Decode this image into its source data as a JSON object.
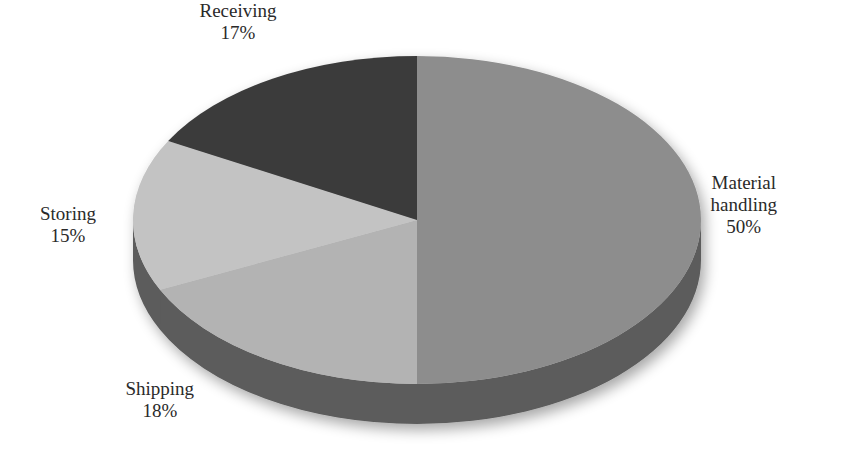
{
  "chart_data": {
    "type": "pie",
    "style": "3d-pie",
    "title": "",
    "start_angle_deg": 0,
    "direction": "clockwise",
    "slices": [
      {
        "label": "Material handling",
        "label_lines": [
          "Material",
          "handling"
        ],
        "value": 50,
        "pct_text": "50%",
        "color": "#8d8d8d",
        "label_pos": {
          "x": 744,
          "y": 205
        }
      },
      {
        "label": "Shipping",
        "label_lines": [
          "Shipping"
        ],
        "value": 18,
        "pct_text": "18%",
        "color": "#b3b3b3",
        "label_pos": {
          "x": 160,
          "y": 400
        }
      },
      {
        "label": "Storing",
        "label_lines": [
          "Storing"
        ],
        "value": 15,
        "pct_text": "15%",
        "color": "#c3c3c3",
        "label_pos": {
          "x": 68,
          "y": 225
        }
      },
      {
        "label": "Receiving",
        "label_lines": [
          "Receiving"
        ],
        "value": 17,
        "pct_text": "17%",
        "color": "#3b3b3b",
        "label_pos": {
          "x": 238,
          "y": 22
        }
      }
    ],
    "categories": [
      "Material handling",
      "Shipping",
      "Storing",
      "Receiving"
    ],
    "values": [
      50,
      18,
      15,
      17
    ],
    "legend": "none (data labels on slices)",
    "side_color": "#5b5b5b"
  },
  "geometry": {
    "cx": 417,
    "cy": 220,
    "rx": 284,
    "ry": 164,
    "depth": 40
  }
}
